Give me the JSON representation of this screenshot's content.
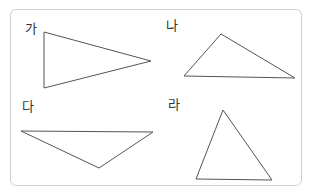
{
  "diagram": {
    "type": "triangle-classification",
    "figures": [
      {
        "label": "가",
        "shape": "obtuse-triangle"
      },
      {
        "label": "나",
        "shape": "obtuse-triangle"
      },
      {
        "label": "다",
        "shape": "obtuse-triangle"
      },
      {
        "label": "라",
        "shape": "acute-triangle"
      }
    ]
  }
}
